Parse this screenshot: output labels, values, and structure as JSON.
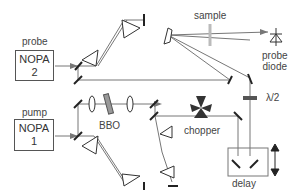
{
  "labels": {
    "probe": "probe",
    "nopa2_line1": "NOPA",
    "nopa2_line2": "2",
    "pump": "pump",
    "nopa1_line1": "NOPA",
    "nopa1_line2": "1",
    "sample": "sample",
    "probe_diode_line1": "probe",
    "probe_diode_line2": "diode",
    "bbo": "BBO",
    "chopper": "chopper",
    "waveplate": "λ/2",
    "delay": "delay"
  },
  "colors": {
    "beam": "#777777",
    "component": "#222222",
    "sample": "#bbbbbb"
  }
}
